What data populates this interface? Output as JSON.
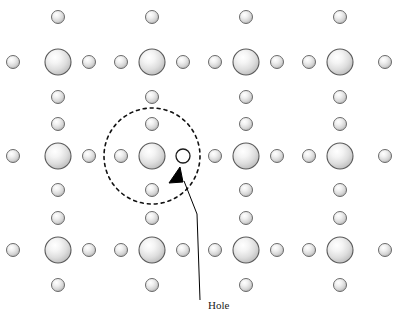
{
  "figure": {
    "width": 394,
    "height": 325,
    "background_color": "#ffffff"
  },
  "annotations": {
    "hole_label": "Hole",
    "hole_label_x": 208,
    "hole_label_y": 309
  },
  "colors": {
    "atom_outline": "#5a5a5a",
    "atom_fill_light": "#fdfdfd",
    "atom_fill_mid": "#e2e2e2",
    "atom_fill_dark": "#b4b4b4",
    "small_atom_outline": "#6b6b6b",
    "hole_outline": "#1a1a1a",
    "hole_fill": "#ffffff",
    "dashed_circle": "#111111",
    "arrow": "#000000",
    "label_text": "#1a1a1a"
  },
  "lattice": {
    "large_atom_radius": 13,
    "small_atom_radius": 6.5,
    "hole_radius": 7,
    "large_atom_columns": [
      58,
      152,
      246,
      340
    ],
    "large_atom_rows": [
      62,
      156,
      250
    ],
    "large_atoms": [
      {
        "cx": 58,
        "cy": 62
      },
      {
        "cx": 152,
        "cy": 62
      },
      {
        "cx": 246,
        "cy": 62
      },
      {
        "cx": 340,
        "cy": 62
      },
      {
        "cx": 58,
        "cy": 156
      },
      {
        "cx": 152,
        "cy": 156
      },
      {
        "cx": 246,
        "cy": 156
      },
      {
        "cx": 340,
        "cy": 156
      },
      {
        "cx": 58,
        "cy": 250
      },
      {
        "cx": 152,
        "cy": 250
      },
      {
        "cx": 246,
        "cy": 250
      },
      {
        "cx": 340,
        "cy": 250
      }
    ],
    "small_atoms": [
      {
        "cx": 58,
        "cy": 17
      },
      {
        "cx": 152,
        "cy": 17
      },
      {
        "cx": 246,
        "cy": 17
      },
      {
        "cx": 340,
        "cy": 17
      },
      {
        "cx": 13,
        "cy": 62
      },
      {
        "cx": 89,
        "cy": 62
      },
      {
        "cx": 121,
        "cy": 62
      },
      {
        "cx": 183,
        "cy": 62
      },
      {
        "cx": 215,
        "cy": 62
      },
      {
        "cx": 277,
        "cy": 62
      },
      {
        "cx": 309,
        "cy": 62
      },
      {
        "cx": 385,
        "cy": 62
      },
      {
        "cx": 58,
        "cy": 97
      },
      {
        "cx": 152,
        "cy": 97
      },
      {
        "cx": 246,
        "cy": 97
      },
      {
        "cx": 340,
        "cy": 97
      },
      {
        "cx": 58,
        "cy": 124
      },
      {
        "cx": 152,
        "cy": 124
      },
      {
        "cx": 246,
        "cy": 124
      },
      {
        "cx": 340,
        "cy": 124
      },
      {
        "cx": 13,
        "cy": 156
      },
      {
        "cx": 89,
        "cy": 156
      },
      {
        "cx": 121,
        "cy": 156
      },
      {
        "cx": 215,
        "cy": 156
      },
      {
        "cx": 277,
        "cy": 156
      },
      {
        "cx": 309,
        "cy": 156
      },
      {
        "cx": 385,
        "cy": 156
      },
      {
        "cx": 58,
        "cy": 190
      },
      {
        "cx": 152,
        "cy": 190
      },
      {
        "cx": 246,
        "cy": 190
      },
      {
        "cx": 340,
        "cy": 190
      },
      {
        "cx": 58,
        "cy": 218
      },
      {
        "cx": 152,
        "cy": 218
      },
      {
        "cx": 246,
        "cy": 218
      },
      {
        "cx": 340,
        "cy": 218
      },
      {
        "cx": 13,
        "cy": 250
      },
      {
        "cx": 89,
        "cy": 250
      },
      {
        "cx": 121,
        "cy": 250
      },
      {
        "cx": 183,
        "cy": 250
      },
      {
        "cx": 215,
        "cy": 250
      },
      {
        "cx": 277,
        "cy": 250
      },
      {
        "cx": 309,
        "cy": 250
      },
      {
        "cx": 385,
        "cy": 250
      },
      {
        "cx": 58,
        "cy": 285
      },
      {
        "cx": 152,
        "cy": 285
      },
      {
        "cx": 246,
        "cy": 285
      },
      {
        "cx": 340,
        "cy": 285
      }
    ],
    "hole": {
      "cx": 183,
      "cy": 156,
      "r": 7
    }
  },
  "dashed_circle": {
    "cx": 152,
    "cy": 156,
    "r": 48,
    "dash_pattern": "3 4",
    "stroke_width": 1.6
  },
  "arrow": {
    "tip_x": 180,
    "tip_y": 167,
    "tail_x": 200,
    "tail_y": 300,
    "bend_x": 197,
    "bend_y": 214
  }
}
